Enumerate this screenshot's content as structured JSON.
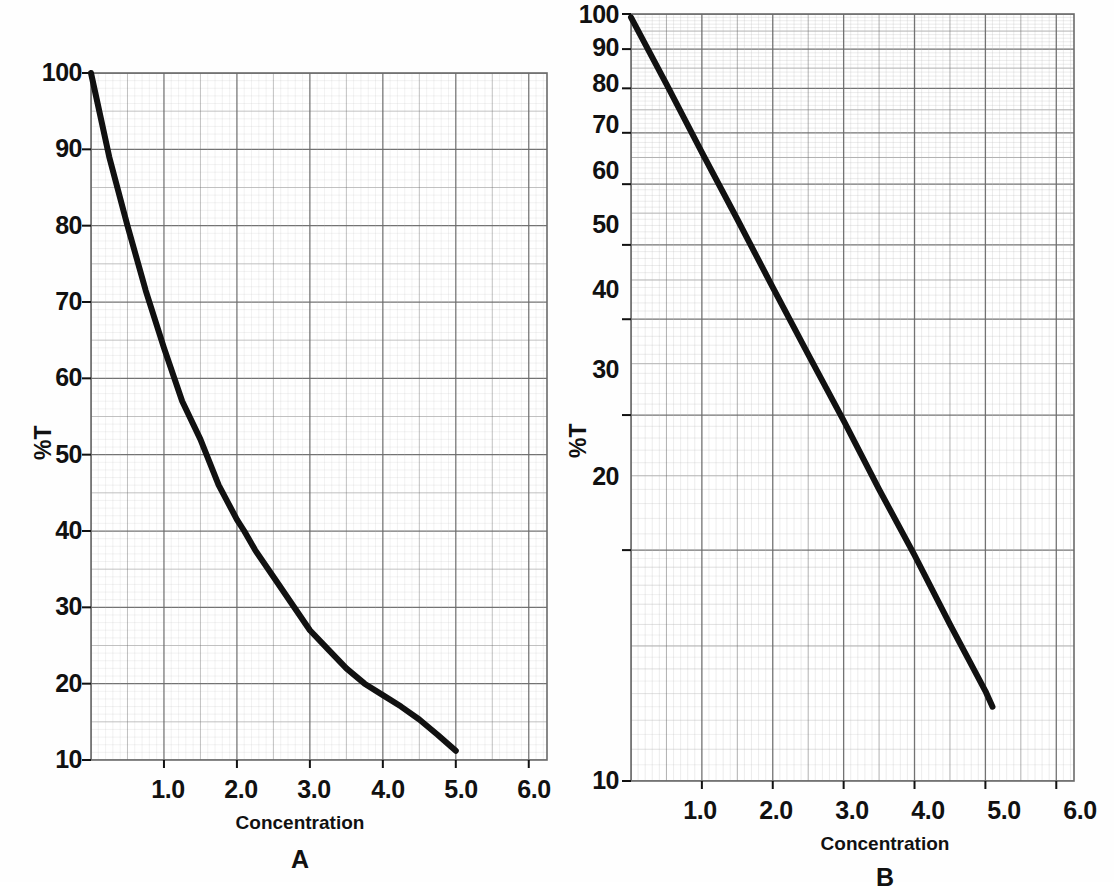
{
  "figure": {
    "background_color": "#fefefe",
    "line_color": "#111111",
    "grid_color": "#6b6b6b",
    "grid_minor_color": "#b9b9b9"
  },
  "panels": [
    {
      "id": "A",
      "letter": "A",
      "ylabel": "%T",
      "xlabel": "Concentration",
      "yticks": [
        "100",
        "90",
        "80",
        "70",
        "60",
        "50",
        "40",
        "30",
        "20",
        "10"
      ],
      "ytick_values": [
        100,
        90,
        80,
        70,
        60,
        50,
        40,
        30,
        20,
        10
      ],
      "xticks": [
        "1.0",
        "2.0",
        "3.0",
        "4.0",
        "5.0",
        "6.0"
      ],
      "xtick_values": [
        1.0,
        2.0,
        3.0,
        4.0,
        5.0,
        6.0
      ],
      "yscale": "linear",
      "xscale": "linear"
    },
    {
      "id": "B",
      "letter": "B",
      "ylabel": "%T",
      "xlabel": "Concentration",
      "yticks": [
        "100",
        "90",
        "80",
        "70",
        "60",
        "50",
        "40",
        "30",
        "20",
        "10"
      ],
      "ytick_values": [
        100,
        90,
        80,
        70,
        60,
        50,
        40,
        30,
        20,
        10
      ],
      "xticks": [
        "1.0",
        "2.0",
        "3.0",
        "4.0",
        "5.0",
        "6.0"
      ],
      "xtick_values": [
        1.0,
        2.0,
        3.0,
        4.0,
        5.0,
        6.0
      ],
      "yscale": "log",
      "xscale": "linear"
    }
  ],
  "chart_data": [
    {
      "type": "line",
      "panel": "A",
      "title": "A",
      "xlabel": "Concentration",
      "ylabel": "%T",
      "yscale": "linear",
      "xlim": [
        0.0,
        6.0
      ],
      "ylim": [
        10,
        100
      ],
      "grid": true,
      "legend": "none",
      "x": [
        0.0,
        0.25,
        0.5,
        0.75,
        1.0,
        1.25,
        1.5,
        1.75,
        2.0,
        2.1,
        2.25,
        2.5,
        2.75,
        3.0,
        3.25,
        3.5,
        3.75,
        4.0,
        4.25,
        4.5,
        4.75,
        5.0
      ],
      "values": [
        100,
        89,
        80,
        71.5,
        64,
        57,
        52,
        46,
        41.5,
        40,
        37.5,
        34,
        30.5,
        27,
        24.5,
        22,
        20,
        18.5,
        17,
        15.3,
        13.3,
        11.2
      ],
      "annotations": [
        "curved line on linear %T axis"
      ]
    },
    {
      "type": "line",
      "panel": "B",
      "title": "B",
      "xlabel": "Concentration",
      "ylabel": "%T",
      "yscale": "log",
      "xlim": [
        0.0,
        6.0
      ],
      "ylim": [
        10,
        100
      ],
      "grid": true,
      "legend": "none",
      "x": [
        0.0,
        0.5,
        1.0,
        1.5,
        2.0,
        2.5,
        3.0,
        3.5,
        4.0,
        4.5,
        5.0,
        5.1
      ],
      "values": [
        99,
        81,
        66,
        54,
        44,
        36,
        29.5,
        24,
        19.7,
        16,
        13.1,
        12.5
      ],
      "annotations": [
        "straight line on logarithmic %T axis"
      ]
    }
  ]
}
